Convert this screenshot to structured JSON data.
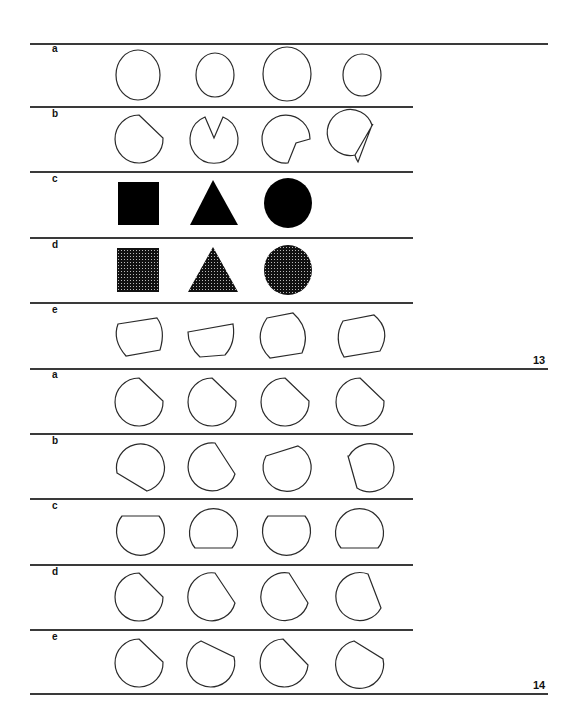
{
  "page": {
    "stroke_color": "#2a2a2a",
    "fill_color": "#000000"
  },
  "plates": [
    {
      "number": "13",
      "rows": [
        {
          "label": "a",
          "description": "four plain circles of different sizes"
        },
        {
          "label": "b",
          "description": "circles with a notch cut out at varying angles"
        },
        {
          "label": "c",
          "description": "solid black square, triangle, circle"
        },
        {
          "label": "d",
          "description": "stippled square, triangle, circle"
        },
        {
          "label": "e",
          "description": "tilted rounded rectangles"
        }
      ]
    },
    {
      "number": "14",
      "rows": [
        {
          "label": "a",
          "description": "identical circles with upper-right chord cut"
        },
        {
          "label": "b",
          "description": "circles with chord cut at different orientations"
        },
        {
          "label": "c",
          "description": "circles with top or bottom chord cut"
        },
        {
          "label": "d",
          "description": "circles with slightly varying chord cuts"
        },
        {
          "label": "e",
          "description": "circles with chord cuts at slightly varying angles"
        }
      ]
    }
  ]
}
